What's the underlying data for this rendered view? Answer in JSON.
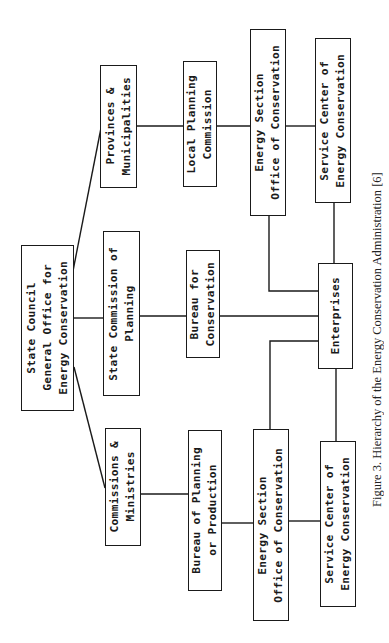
{
  "diagram": {
    "type": "org-hierarchy",
    "orientation": "rotated-90-ccw",
    "nodes": {
      "state_council": "State Council\nGeneral Office for\nEnergy Conservation",
      "provinces": "Provinces &\nMunicipalities",
      "state_commission": "State Commission of\nPlanning",
      "commissions": "Commissions &\nMinistries",
      "local_planning": "Local Planning\nCommission",
      "bureau_conservation": "Bureau for\nConservation",
      "bureau_planning": "Bureau of Planning\nor Production",
      "energy_section_top": "Energy Section\nOffice of Conservation",
      "energy_section_bottom": "Energy Section\nOffice of Conservation",
      "service_center_top": "Service Center of\nEnergy Conservation",
      "service_center_bottom": "Service Center of\nEnergy Conservation",
      "enterprises": "Enterprises"
    },
    "edges": [
      [
        "state_council",
        "provinces"
      ],
      [
        "state_council",
        "state_commission"
      ],
      [
        "state_council",
        "commissions"
      ],
      [
        "provinces",
        "local_planning"
      ],
      [
        "local_planning",
        "energy_section_top"
      ],
      [
        "energy_section_top",
        "service_center_top"
      ],
      [
        "energy_section_top",
        "enterprises"
      ],
      [
        "service_center_top",
        "enterprises"
      ],
      [
        "state_commission",
        "bureau_conservation"
      ],
      [
        "bureau_conservation",
        "enterprises"
      ],
      [
        "commissions",
        "bureau_planning"
      ],
      [
        "bureau_planning",
        "energy_section_bottom"
      ],
      [
        "energy_section_bottom",
        "service_center_bottom"
      ],
      [
        "energy_section_bottom",
        "enterprises"
      ],
      [
        "service_center_bottom",
        "enterprises"
      ]
    ]
  },
  "caption": "Figure 3.   Hierarchy of the Energy Conservation Administration [6]"
}
